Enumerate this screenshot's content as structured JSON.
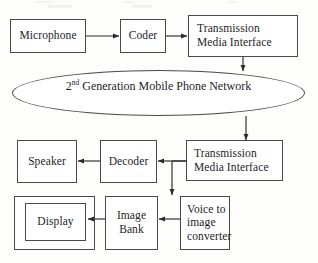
{
  "diagram": {
    "stroke_color": "#4a4a4d",
    "text_color": "#1d1d1f",
    "background_color": "#fdfdfc",
    "network": {
      "prefix": "2",
      "ordinal_suffix": "nd",
      "label": " Generation Mobile Phone Network"
    },
    "nodes": {
      "microphone": "Microphone",
      "coder": "Coder",
      "tx_interface_top_line1": "Transmission",
      "tx_interface_top_line2": "Media Interface",
      "tx_interface_bottom_line1": "Transmission",
      "tx_interface_bottom_line2": "Media Interface",
      "speaker": "Speaker",
      "decoder": "Decoder",
      "display": "Display",
      "image_bank_line1": "Image",
      "image_bank_line2": "Bank",
      "voice_converter_line1": "Voice to",
      "voice_converter_line2": "image",
      "voice_converter_line3": "converter"
    }
  }
}
